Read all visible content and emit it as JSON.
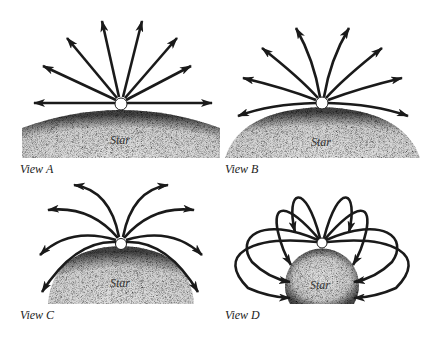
{
  "figure": {
    "panels": [
      {
        "id": "A",
        "label": "View A",
        "star_label": "Star",
        "description": "Straight field lines radiating outward from a point on the star surface"
      },
      {
        "id": "B",
        "label": "View B",
        "star_label": "Star",
        "description": "Field lines radiating outward, curving slightly downward at the sides"
      },
      {
        "id": "C",
        "label": "View C",
        "star_label": "Star",
        "description": "Field lines curving outward and down, not returning to the star"
      },
      {
        "id": "D",
        "label": "View D",
        "star_label": "Star",
        "description": "Closed field line loops leaving the top and returning to the star surface"
      }
    ],
    "colors": {
      "line": "#1a1a1a",
      "star_fill": "#d8d8d8",
      "star_edge": "#3a3a3a",
      "background": "#ffffff"
    }
  }
}
